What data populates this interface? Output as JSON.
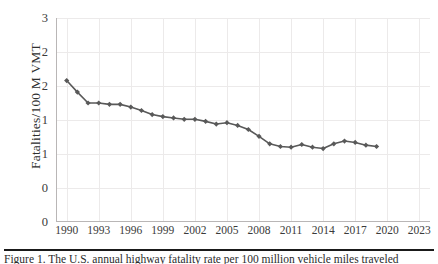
{
  "chart_data": {
    "type": "line",
    "title": "",
    "xlabel": "",
    "ylabel": "Fatalities/100 M  VMT",
    "xlim": [
      1989,
      2024
    ],
    "ylim": [
      0,
      3
    ],
    "grid": true,
    "legend": "none",
    "marker": "diamond",
    "series_color": "#595959",
    "x_tick_labels": [
      "1990",
      "1993",
      "1996",
      "1999",
      "2002",
      "2005",
      "2008",
      "2011",
      "2014",
      "2017",
      "2020",
      "2023"
    ],
    "x_tick_values": [
      1990,
      1993,
      1996,
      1999,
      2002,
      2005,
      2008,
      2011,
      2014,
      2017,
      2020,
      2023
    ],
    "y_tick_labels": [
      "3",
      "2",
      "2",
      "1",
      "1",
      "0"
    ],
    "y_tick_values": [
      3.0,
      2.5,
      2.0,
      1.5,
      1.0,
      0.5
    ],
    "y_axis_origin_label": "0",
    "x": [
      1990,
      1991,
      1992,
      1993,
      1994,
      1995,
      1996,
      1997,
      1998,
      1999,
      2000,
      2001,
      2002,
      2003,
      2004,
      2005,
      2006,
      2007,
      2008,
      2009,
      2010,
      2011,
      2012,
      2013,
      2014,
      2015,
      2016,
      2017,
      2018,
      2019
    ],
    "values": [
      2.08,
      1.91,
      1.75,
      1.75,
      1.73,
      1.73,
      1.69,
      1.64,
      1.58,
      1.55,
      1.53,
      1.51,
      1.51,
      1.48,
      1.44,
      1.46,
      1.42,
      1.36,
      1.26,
      1.15,
      1.11,
      1.1,
      1.14,
      1.1,
      1.08,
      1.15,
      1.19,
      1.17,
      1.13,
      1.11
    ]
  },
  "caption": {
    "line1": "Figure 1. The U.S. annual highway fatality rate per 100 million vehicle miles traveled"
  },
  "colors": {
    "series": "#595959",
    "grid": "#eceaea",
    "axis": "#b9b6b6",
    "text": "#3a3a3a",
    "caption_rule": "#1a1a1a"
  }
}
